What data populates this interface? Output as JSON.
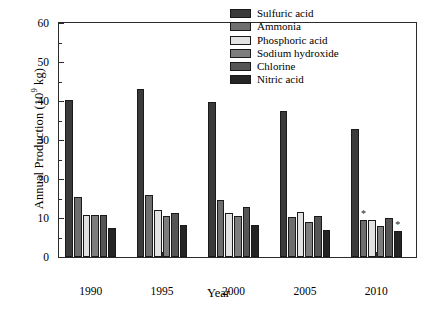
{
  "chart_data": {
    "type": "bar",
    "title": "",
    "subtitle": "",
    "xlabel": "Year",
    "ylabel": "Annual Production (10⁹ kg)",
    "ylabel_prefix": "Annual Production (10",
    "ylabel_exponent": "9",
    "ylabel_suffix": " kg)",
    "categories": [
      "1990",
      "1995",
      "2000",
      "2005",
      "2010"
    ],
    "ylim": [
      0,
      60
    ],
    "yticks": [
      0,
      10,
      20,
      30,
      40,
      50,
      60
    ],
    "ytick_labels": [
      "0",
      "10",
      "20",
      "30",
      "40",
      "50",
      "60"
    ],
    "grid": false,
    "legend_position": "top-right",
    "series": [
      {
        "name": "Sulfuric acid",
        "color": "#3a3a3a",
        "values": [
          40.3,
          43.2,
          39.8,
          37.5,
          32.8
        ]
      },
      {
        "name": "Ammonia",
        "color": "#6e6e6e",
        "values": [
          15.3,
          15.9,
          14.5,
          10.3,
          9.6
        ]
      },
      {
        "name": "Phosphoric acid",
        "color": "#e2e2e2",
        "values": [
          10.9,
          12.0,
          11.4,
          11.6,
          9.6
        ]
      },
      {
        "name": "Sodium hydroxide",
        "color": "#7d7d7d",
        "values": [
          10.9,
          10.4,
          10.6,
          8.9,
          7.9
        ]
      },
      {
        "name": "Chlorine",
        "color": "#555555",
        "values": [
          10.7,
          11.3,
          12.9,
          10.5,
          10.1
        ]
      },
      {
        "name": "Nitric acid",
        "color": "#242424",
        "values": [
          7.4,
          8.2,
          8.1,
          7.0,
          6.6
        ]
      }
    ],
    "annotations": [
      {
        "text": "*",
        "category": "2010",
        "series": "Ammonia",
        "value": 9.6
      },
      {
        "text": "*",
        "category": "2010",
        "series": "Nitric acid",
        "value": 6.6
      }
    ]
  }
}
